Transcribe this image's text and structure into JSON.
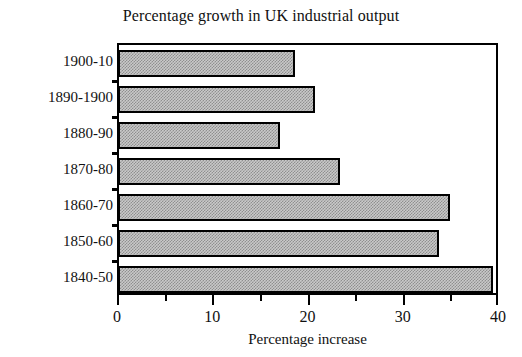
{
  "chart_data": {
    "type": "bar",
    "orientation": "horizontal",
    "title": "Percentage growth in UK industrial output",
    "xlabel": "Percentage increase",
    "ylabel": "",
    "categories": [
      "1900-10",
      "1890-1900",
      "1880-90",
      "1870-80",
      "1860-70",
      "1850-60",
      "1840-50"
    ],
    "values": [
      18.5,
      20.6,
      16.9,
      23.2,
      34.7,
      33.6,
      39.3
    ],
    "xlim": [
      0,
      40
    ],
    "xticks": [
      0,
      10,
      20,
      30,
      40
    ],
    "xtick_labels": [
      "0",
      "10",
      "20",
      "30",
      "40"
    ],
    "xticks_minor": [
      5,
      15,
      25,
      35
    ],
    "grid": false,
    "legend": false,
    "bar_fill": "#c9c9c9",
    "bar_pattern": "checkerboard-dither",
    "bar_edge_color": "#000000",
    "frame_color": "#000000",
    "background": "#ffffff"
  }
}
